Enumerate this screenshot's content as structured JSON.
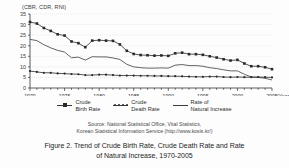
{
  "figure": {
    "y_axis_title": "(CBR, CDR, RNI)",
    "x_axis_unit": "(Year)"
  },
  "legend": {
    "items": [
      {
        "label": "Crude\nBirth Rate",
        "symbol": "line-with-square-markers",
        "color": "#2a2a2a"
      },
      {
        "label": "Crude\nDeath Rate",
        "symbol": "line-with-dot-markers",
        "color": "#2a2a2a"
      },
      {
        "label": "Rate of\nNatural Increase",
        "symbol": "plain-line",
        "color": "#3c3c3c"
      }
    ]
  },
  "source": {
    "line1": "Source: National Statistical Office, Vital Statistics,",
    "line2": "Korean Statistical Information Service (http://www.kosis.kr/)"
  },
  "caption": {
    "line1": "Figure 2. Trend of Crude Birth Rate, Crude Death Rate and Rate",
    "line2": "of Natural Increase, 1970-2005"
  },
  "chart_data": {
    "type": "line",
    "title": "Figure 2. Trend of Crude Birth Rate, Crude Death Rate and Rate of Natural Increase, 1970-2005",
    "xlabel": "(Year)",
    "ylabel": "(CBR, CDR, RNI)",
    "xlim": [
      1970,
      2005
    ],
    "ylim": [
      0,
      35
    ],
    "yticks": [
      0,
      5,
      10,
      15,
      20,
      25,
      30,
      35
    ],
    "xticks": [
      1970,
      1975,
      1980,
      1985,
      1990,
      1995,
      2000,
      2005
    ],
    "grid": true,
    "legend_position": "below-plot",
    "x": [
      1970,
      1971,
      1972,
      1973,
      1974,
      1975,
      1976,
      1977,
      1978,
      1979,
      1980,
      1981,
      1982,
      1983,
      1984,
      1985,
      1986,
      1987,
      1988,
      1989,
      1990,
      1991,
      1992,
      1993,
      1994,
      1995,
      1996,
      1997,
      1998,
      1999,
      2000,
      2001,
      2002,
      2003,
      2004,
      2005
    ],
    "series": [
      {
        "name": "Crude Birth Rate",
        "marker": "square",
        "values": [
          31.2,
          30.5,
          28.4,
          27.0,
          25.4,
          24.8,
          22.0,
          21.2,
          19.3,
          22.4,
          22.6,
          22.4,
          22.3,
          20.6,
          17.6,
          16.1,
          15.6,
          15.5,
          15.3,
          15.4,
          15.2,
          16.4,
          16.7,
          16.0,
          16.0,
          15.7,
          15.0,
          14.4,
          13.6,
          13.0,
          13.3,
          11.6,
          10.3,
          10.3,
          9.8,
          8.9
        ],
        "color": "#2a2a2a"
      },
      {
        "name": "Rate of Natural Increase",
        "marker": "none",
        "values": [
          23.0,
          22.4,
          20.5,
          19.0,
          17.8,
          17.0,
          14.3,
          14.6,
          13.2,
          14.8,
          14.7,
          14.7,
          14.2,
          13.5,
          11.2,
          10.0,
          9.6,
          9.4,
          9.4,
          9.5,
          9.4,
          10.8,
          11.1,
          10.6,
          10.6,
          10.3,
          9.6,
          9.2,
          8.6,
          8.1,
          8.1,
          6.5,
          5.2,
          5.0,
          4.6,
          3.8
        ],
        "color": "#3c3c3c"
      },
      {
        "name": "Crude Death Rate",
        "marker": "dot",
        "values": [
          8.0,
          7.6,
          7.2,
          7.2,
          6.9,
          6.8,
          6.6,
          6.5,
          6.1,
          6.1,
          6.3,
          6.3,
          6.1,
          5.9,
          5.9,
          5.9,
          5.8,
          5.8,
          5.7,
          5.7,
          5.6,
          5.6,
          5.5,
          5.4,
          5.3,
          5.3,
          5.4,
          5.4,
          5.2,
          5.1,
          5.2,
          5.1,
          5.1,
          5.2,
          5.1,
          5.0
        ],
        "color": "#2a2a2a"
      }
    ]
  }
}
